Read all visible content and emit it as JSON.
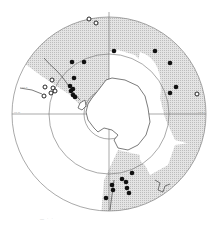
{
  "map": {
    "type": "south-polar-stereographic",
    "center": [
      109,
      114
    ],
    "circles": {
      "outer_r": 97,
      "middle_r": 60,
      "inner_r": 25
    },
    "colors": {
      "shade": "#d4d4d4",
      "line": "#6e6e6e",
      "coast": "#444444",
      "dot": "#111111",
      "background": "#ffffff"
    },
    "meridian_labels": [
      {
        "text": "90°W",
        "x": 14,
        "y": 113
      },
      {
        "text": "90°E",
        "x": 198,
        "y": 113
      },
      {
        "text": "60°S",
        "x": 22,
        "y": 88
      }
    ],
    "filled_points": [
      [
        114,
        51
      ],
      [
        155,
        51
      ],
      [
        72,
        62
      ],
      [
        84,
        62
      ],
      [
        170,
        63
      ],
      [
        74,
        78
      ],
      [
        70,
        86
      ],
      [
        73,
        89
      ],
      [
        71,
        91
      ],
      [
        73,
        95
      ],
      [
        75,
        97
      ],
      [
        176,
        87
      ],
      [
        170,
        93
      ],
      [
        132,
        173
      ],
      [
        122,
        179
      ],
      [
        126,
        182
      ],
      [
        112,
        185
      ],
      [
        113,
        190
      ],
      [
        127,
        188
      ],
      [
        129,
        193
      ],
      [
        106,
        198
      ]
    ],
    "open_points": [
      [
        89,
        19
      ],
      [
        96,
        23
      ],
      [
        52,
        80
      ],
      [
        45,
        87
      ],
      [
        53,
        88
      ],
      [
        55,
        91
      ],
      [
        51,
        93
      ],
      [
        44,
        96
      ],
      [
        197,
        94
      ]
    ],
    "caption": "— · ·"
  }
}
